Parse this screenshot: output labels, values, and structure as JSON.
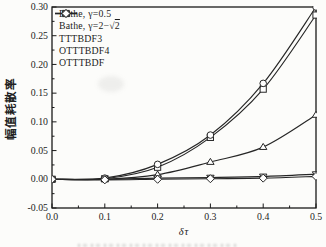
{
  "figure": {
    "background": "#fcfcfa",
    "ink": "#262626",
    "frame_color": "#1a1a1a"
  },
  "chart_data": {
    "type": "line",
    "title": "",
    "xlabel": "δτ",
    "ylabel": "幅值耗散率",
    "xlim": [
      0.0,
      0.5
    ],
    "ylim": [
      -0.05,
      0.3
    ],
    "grid": false,
    "legend_position": "upper-left",
    "x_tick_labels": [
      "0.0",
      "0.1",
      "0.2",
      "0.3",
      "0.4",
      "0.5"
    ],
    "x_major_ticks": [
      0.0,
      0.1,
      0.2,
      0.3,
      0.4,
      0.5
    ],
    "x_minor_step": 0.05,
    "y_tick_labels": [
      "-0.05",
      "0.00",
      "0.05",
      "0.10",
      "0.15",
      "0.20",
      "0.25",
      "0.30"
    ],
    "y_major_ticks": [
      -0.05,
      0.0,
      0.05,
      0.1,
      0.15,
      0.2,
      0.25,
      0.3
    ],
    "y_minor_step": 0.025,
    "x": [
      0.0,
      0.1,
      0.2,
      0.3,
      0.4,
      0.5
    ],
    "series": [
      {
        "name": "Bathe, γ=0.5",
        "marker": "square",
        "values": [
          0.0,
          0.001,
          0.021,
          0.073,
          0.157,
          0.286
        ]
      },
      {
        "name": "Bathe, γ=2−√2",
        "marker": "circle",
        "values": [
          0.0,
          0.002,
          0.026,
          0.077,
          0.167,
          0.3
        ]
      },
      {
        "name": "TTTBDF3",
        "marker": "triangle-up",
        "values": [
          0.0,
          0.0,
          0.008,
          0.03,
          0.056,
          0.112
        ]
      },
      {
        "name": "OTTTBDF4",
        "marker": "triangle-down",
        "values": [
          0.0,
          0.0,
          0.002,
          0.003,
          0.005,
          0.009
        ]
      },
      {
        "name": "OTTTBDF",
        "marker": "diamond",
        "values": [
          0.0,
          -0.001,
          0.0,
          0.001,
          0.002,
          0.005
        ]
      }
    ]
  }
}
